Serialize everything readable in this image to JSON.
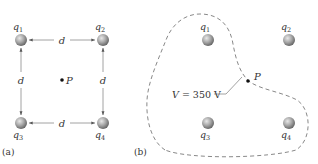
{
  "figure": {
    "panel_a": {
      "caption": "(a)",
      "charges": [
        {
          "name": "q",
          "sub": "1",
          "x": 21,
          "y": 40,
          "label_pos": "above"
        },
        {
          "name": "q",
          "sub": "2",
          "x": 103,
          "y": 40,
          "label_pos": "above"
        },
        {
          "name": "q",
          "sub": "3",
          "x": 21,
          "y": 123,
          "label_pos": "below"
        },
        {
          "name": "q",
          "sub": "4",
          "x": 103,
          "y": 123,
          "label_pos": "below"
        }
      ],
      "distance_label": "d",
      "point": {
        "label": "P",
        "x": 62,
        "y": 80
      }
    },
    "panel_b": {
      "caption": "(b)",
      "charges": [
        {
          "name": "q",
          "sub": "1",
          "x": 208,
          "y": 40,
          "label_pos": "above"
        },
        {
          "name": "q",
          "sub": "2",
          "x": 289,
          "y": 40,
          "label_pos": "above"
        },
        {
          "name": "q",
          "sub": "3",
          "x": 208,
          "y": 123,
          "label_pos": "below"
        },
        {
          "name": "q",
          "sub": "4",
          "x": 289,
          "y": 123,
          "label_pos": "below"
        }
      ],
      "point": {
        "label": "P",
        "x": 249,
        "y": 81
      },
      "equipotential_label": {
        "var": "V",
        "text": " = 350 V"
      }
    },
    "colors": {
      "sphere_light": "#d9d9d9",
      "sphere_dark": "#6e6e6e",
      "line": "#8a8a8a",
      "dashed_curve": "#7a7a7a",
      "text": "#333333"
    }
  }
}
